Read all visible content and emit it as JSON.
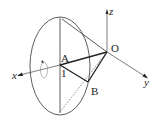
{
  "diagram": {
    "type": "cone-rotation-3d",
    "labels": {
      "A": "A",
      "B": "B",
      "O": "O",
      "one": "1",
      "x_axis": "x",
      "y_axis": "y",
      "z_axis": "z"
    },
    "colors": {
      "stroke": "#222222",
      "background": "#ffffff"
    }
  }
}
